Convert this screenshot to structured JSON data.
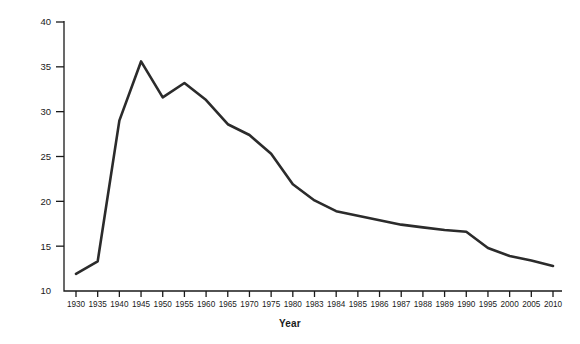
{
  "chart_data": {
    "type": "line",
    "title": "",
    "xlabel": "Year",
    "ylabel": "Percent of the Labor Force",
    "grid": false,
    "legend": "none",
    "ylim": [
      10,
      40
    ],
    "yticks": [
      10,
      15,
      20,
      25,
      30,
      35,
      40
    ],
    "categories": [
      "1930",
      "1935",
      "1940",
      "1945",
      "1950",
      "1955",
      "1960",
      "1965",
      "1970",
      "1975",
      "1980",
      "1983",
      "1984",
      "1985",
      "1986",
      "1987",
      "1988",
      "1989",
      "1990",
      "1995",
      "2000",
      "2005",
      "2010"
    ],
    "values": [
      11.9,
      13.3,
      29.0,
      35.6,
      31.6,
      33.2,
      31.3,
      28.6,
      27.4,
      25.3,
      21.9,
      20.1,
      18.9,
      18.4,
      17.9,
      17.4,
      17.1,
      16.8,
      16.6,
      14.8,
      13.9,
      13.4,
      12.8
    ],
    "series_name": "Percent of the Labor Force",
    "line_color": "#2b2b2b",
    "line_width": 2.6
  },
  "axes": {
    "y_axis_label": "Percent of the Labor Force",
    "x_axis_label": "Year"
  }
}
